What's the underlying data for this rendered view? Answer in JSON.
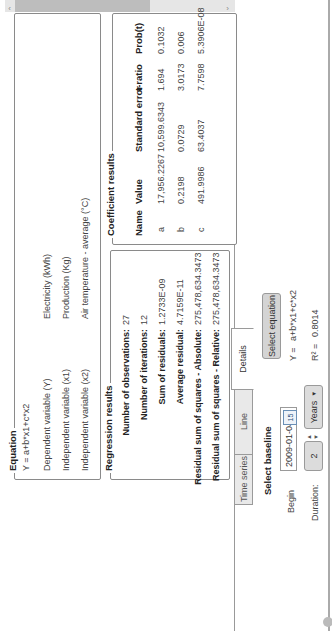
{
  "scrollbar": {
    "left_arrow": "‹",
    "right_arrow": "›",
    "position": 0.0,
    "visible_fraction": 0.58
  },
  "equation": {
    "title": "Equation",
    "formula": "Y = a+b*x1+c*x2",
    "rows": [
      {
        "label": "Dependent variable (Y)",
        "value": "Electricity  (kWh)"
      },
      {
        "label": "Independent variable (x1)",
        "value": "Production (Kg)"
      },
      {
        "label": "Independent variable (x2)",
        "value": "Air temperature - average (°C)"
      }
    ]
  },
  "regression": {
    "title": "Regression results",
    "rows": [
      {
        "label": "Number of observations:",
        "value": "27"
      },
      {
        "label": "Number of iterations:",
        "value": "12"
      },
      {
        "label": "Sum of residuals:",
        "value": "1.2733E-09"
      },
      {
        "label": "Average residual:",
        "value": "4.7159E-11"
      },
      {
        "label": "Residual sum of squares - Absolute:",
        "value": "275,478,634.3473"
      },
      {
        "label": "Residual sum of squares - Relative:",
        "value": "275,478,634.3473"
      }
    ]
  },
  "coefficients": {
    "title": "Coefficient results",
    "columns": [
      "Name",
      "Value",
      "Standard error",
      "t-ratio",
      "Prob(t)"
    ],
    "rows": [
      [
        "a",
        "17,956.2267",
        "10,599.6343",
        "1.694",
        "0.1032"
      ],
      [
        "b",
        "0.2198",
        "0.0729",
        "3.0173",
        "0.006"
      ],
      [
        "c",
        "491.9986",
        "63.4037",
        "7.7598",
        "5.3906E-08"
      ]
    ]
  },
  "tabs": [
    {
      "label": "Time series",
      "active": false
    },
    {
      "label": "Line",
      "active": false
    },
    {
      "label": "Details",
      "active": true
    }
  ],
  "baseline": {
    "title": "Select baseline",
    "begin_label": "Begin",
    "begin_value": "2009-01-04",
    "calendar_icon_text": "15",
    "duration_label": "Duration:",
    "duration_value": "2",
    "duration_unit": "Years",
    "select_equation_label": "Select equation",
    "equation_prefix": "Y =",
    "equation_value": "a+b*x1+c*x2",
    "r2_label": "R² =",
    "r2_value": "0.8014"
  }
}
